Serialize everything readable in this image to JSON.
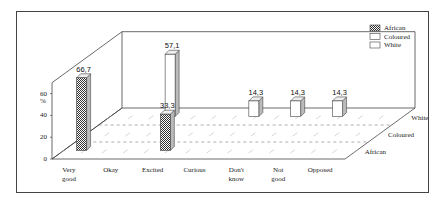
{
  "chart_data": {
    "type": "bar",
    "subtype": "3d-grouped",
    "title": "",
    "ylabel": "%",
    "xlabel": "",
    "ylim": [
      0,
      70
    ],
    "yticks": [
      "0",
      "20",
      "40",
      "60"
    ],
    "categories": [
      "Very good",
      "Okay",
      "Excited",
      "Curious",
      "Don't know",
      "Not good",
      "Opposed"
    ],
    "category_lines": [
      [
        "Very",
        "good"
      ],
      [
        "Okay"
      ],
      [
        "Excited"
      ],
      [
        "Curious"
      ],
      [
        "Don't",
        "know"
      ],
      [
        "Not",
        "good"
      ],
      [
        "Opposed"
      ]
    ],
    "depth_labels": [
      "White",
      "Coloured",
      "African"
    ],
    "legend": [
      "African",
      "Coloured",
      "White"
    ],
    "legend_position": "top-right",
    "series": [
      {
        "name": "African",
        "pattern": "checkered",
        "values": [
          66.7,
          null,
          33.3,
          null,
          null,
          null,
          null
        ],
        "labels": [
          "66,7",
          "",
          "33,3",
          "",
          "",
          "",
          ""
        ]
      },
      {
        "name": "Coloured",
        "pattern": "white",
        "values": [
          null,
          null,
          null,
          null,
          null,
          null,
          null
        ],
        "labels": [
          "",
          "",
          "",
          "",
          "",
          "",
          ""
        ]
      },
      {
        "name": "White",
        "pattern": "white",
        "values": [
          null,
          57.1,
          null,
          14.3,
          14.3,
          14.3,
          null
        ],
        "labels": [
          "",
          "57,1",
          "",
          "14,3",
          "14,3",
          "14,3",
          ""
        ]
      }
    ]
  }
}
